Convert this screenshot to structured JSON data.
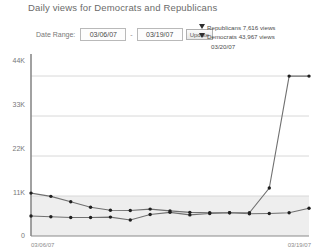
{
  "chart_title": "Daily views for Democrats and Republicans",
  "controls": {
    "date_range_label": "Date Range:",
    "start_date": "03/06/07",
    "end_date": "03/19/07",
    "dash": "-",
    "update_label": "Update"
  },
  "hover_legend": {
    "series_1_text": "Republicans 7,616 views",
    "series_2_text": "Democrats 43,967 views",
    "hover_date": "03/20/07"
  },
  "axis": {
    "y_ticks": [
      "44K",
      "33K",
      "22K",
      "11K",
      "0"
    ],
    "x_ticks": [
      "03/06/07",
      "03/19/07"
    ]
  },
  "colors": {
    "line": "#707070",
    "marker": "#1f1f1f",
    "gridline": "#d8d8d8",
    "axis": "#8a8a8a",
    "band": "#eeeeee",
    "title_text": "#6b6b6b"
  },
  "chart_data": {
    "type": "line",
    "title": "Daily views for Democrats and Republicans",
    "xlabel": "",
    "ylabel": "",
    "ylim": [
      0,
      48400
    ],
    "grid": true,
    "legend_position": "hover-tooltip",
    "y_tick_values": [
      0,
      11000,
      22000,
      33000,
      44000
    ],
    "x": [
      "03/06/07",
      "03/07/07",
      "03/08/07",
      "03/09/07",
      "03/10/07",
      "03/11/07",
      "03/12/07",
      "03/13/07",
      "03/14/07",
      "03/15/07",
      "03/16/07",
      "03/17/07",
      "03/18/07",
      "03/19/07",
      "03/20/07"
    ],
    "series": [
      {
        "name": "Democrats",
        "values": [
          11800,
          10900,
          9400,
          7900,
          7100,
          7000,
          7400,
          6900,
          6500,
          6400,
          6400,
          6400,
          13200,
          43967,
          43967
        ]
      },
      {
        "name": "Republicans",
        "values": [
          5500,
          5300,
          5100,
          5100,
          5200,
          4400,
          5900,
          6500,
          5800,
          6200,
          6400,
          6100,
          6200,
          6400,
          7616
        ]
      }
    ],
    "annotations": [
      {
        "text": "Republicans 7,616 views",
        "at": "03/20/07"
      },
      {
        "text": "Democrats 43,967 views",
        "at": "03/20/07"
      },
      {
        "text": "03/20/07",
        "at": "03/20/07"
      }
    ]
  }
}
